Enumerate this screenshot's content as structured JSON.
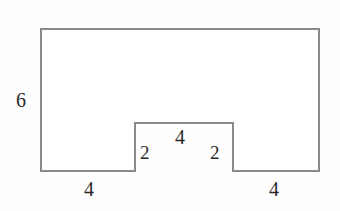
{
  "figure": {
    "kind": "geometry-diagram",
    "stroke_color": "#8a8a8a",
    "background_color": "#fefefe",
    "label_color": "#2a2a2a",
    "stroke_width": 2,
    "outline_path": "M 41 29 L 319 29 L 319 171 L 233 171 L 233 123 L 135 123 L 135 171 L 41 171 Z",
    "vertices": [
      {
        "name": "top-left",
        "x": 41,
        "y": 29
      },
      {
        "name": "top-right",
        "x": 319,
        "y": 29
      },
      {
        "name": "bottom-right",
        "x": 319,
        "y": 171
      },
      {
        "name": "notch-bottom-right",
        "x": 233,
        "y": 171
      },
      {
        "name": "notch-top-right",
        "x": 233,
        "y": 123
      },
      {
        "name": "notch-top-left",
        "x": 135,
        "y": 123
      },
      {
        "name": "notch-bottom-left",
        "x": 135,
        "y": 171
      },
      {
        "name": "bottom-left",
        "x": 41,
        "y": 171
      }
    ],
    "labels": {
      "left_height": "6",
      "bottom_left_width": "4",
      "notch_left_height": "2",
      "notch_top_width": "4",
      "notch_right_height": "2",
      "bottom_right_width": "4"
    }
  }
}
